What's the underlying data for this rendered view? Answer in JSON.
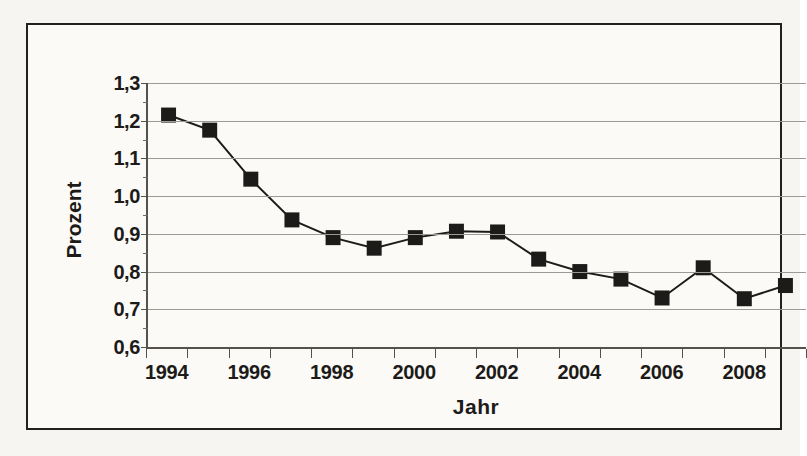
{
  "figure": {
    "y_axis_title": "Prozent",
    "x_axis_title": "Jahr"
  },
  "chart_data": {
    "type": "line",
    "title": "",
    "subtitle": "",
    "xlabel": "Jahr",
    "ylabel": "Prozent",
    "x": [
      1994,
      1995,
      1996,
      1997,
      1998,
      1999,
      2000,
      2001,
      2002,
      2003,
      2004,
      2005,
      2006,
      2007,
      2008,
      2009
    ],
    "values": [
      1.215,
      1.175,
      1.045,
      0.937,
      0.89,
      0.862,
      0.89,
      0.907,
      0.905,
      0.833,
      0.8,
      0.78,
      0.73,
      0.81,
      0.728,
      0.763
    ],
    "series": [
      {
        "name": "Prozent",
        "values": [
          1.215,
          1.175,
          1.045,
          0.937,
          0.89,
          0.862,
          0.89,
          0.907,
          0.905,
          0.833,
          0.8,
          0.78,
          0.73,
          0.81,
          0.728,
          0.763
        ]
      }
    ],
    "ylim": [
      0.6,
      1.3
    ],
    "ytick_values": [
      0.6,
      0.7,
      0.8,
      0.9,
      1.0,
      1.1,
      1.2,
      1.3
    ],
    "ytick_labels": [
      "0,6",
      "0,7",
      "0,8",
      "0,9",
      "1,0",
      "1,1",
      "1,2",
      "1,3"
    ],
    "xtick_labels": [
      "1994",
      "1996",
      "1998",
      "2000",
      "2002",
      "2004",
      "2006",
      "2008"
    ],
    "xtick_values": [
      1994,
      1996,
      1998,
      2000,
      2002,
      2004,
      2006,
      2008
    ],
    "grid": true,
    "grid_axis": "y",
    "legend": false,
    "legend_position": "none",
    "marker": "square",
    "marker_color": "#1d1b19",
    "line_color": "#1d1b19",
    "decimal_separator": ","
  },
  "colors": {
    "ink": "#1d1b19",
    "grid": "#9d9a95",
    "axis": "#55524e",
    "paper": "#fbfaf7",
    "scan_background": "#f7f5f1"
  }
}
